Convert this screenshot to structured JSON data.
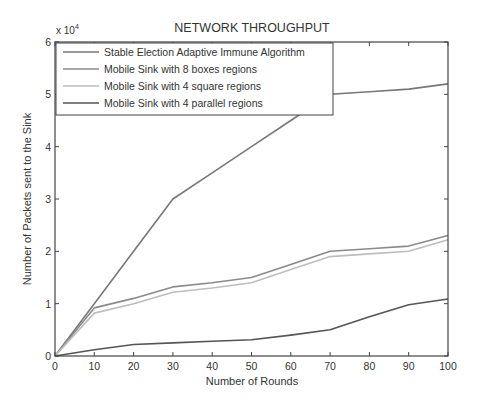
{
  "chart_data": {
    "type": "line",
    "title": "NETWORK THROUGHPUT",
    "xlabel": "Number of Rounds",
    "ylabel": "Number of Packets sent to the Sink",
    "y_multiplier_label": "x 10",
    "y_multiplier_exponent": "4",
    "xlim": [
      0,
      100
    ],
    "ylim": [
      0,
      6
    ],
    "y_scale": 10000,
    "x_ticks": [
      0,
      10,
      20,
      30,
      40,
      50,
      60,
      70,
      80,
      90,
      100
    ],
    "y_ticks": [
      0,
      1,
      2,
      3,
      4,
      5,
      6
    ],
    "grid": false,
    "legend_position": "upper left",
    "x": [
      0,
      10,
      20,
      30,
      40,
      50,
      60,
      70,
      80,
      90,
      100
    ],
    "series": [
      {
        "name": "Stable Election Adaptive Immune Algorithm",
        "color": "#777777",
        "values": [
          0,
          10000,
          20000,
          30000,
          35000,
          40000,
          45000,
          50000,
          50500,
          51000,
          52000
        ]
      },
      {
        "name": "Mobile Sink with 8 boxes regions",
        "color": "#8a8a8a",
        "values": [
          0,
          9200,
          11000,
          13200,
          14000,
          15000,
          17500,
          20000,
          20500,
          21000,
          23000
        ]
      },
      {
        "name": "Mobile Sink with 4 square regions",
        "color": "#bdbdbd",
        "values": [
          0,
          8200,
          10000,
          12200,
          13000,
          14000,
          16500,
          19000,
          19500,
          20000,
          22200
        ]
      },
      {
        "name": "Mobile Sink with 4 parallel regions",
        "color": "#555555",
        "values": [
          0,
          1200,
          2200,
          2500,
          2800,
          3100,
          4000,
          5000,
          7500,
          9800,
          10900
        ]
      }
    ]
  }
}
